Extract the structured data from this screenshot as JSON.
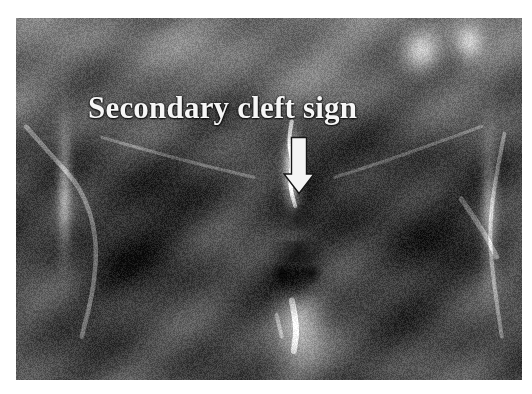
{
  "figure": {
    "kind": "medical-image",
    "modality": "MRI",
    "view": "coronal pelvis / pubic symphysis",
    "background_color": "#ffffff",
    "plate": {
      "x": 16,
      "y": 18,
      "width": 506,
      "height": 362,
      "base_color": "#2e2e2e"
    }
  },
  "annotation": {
    "label_text": "Secondary cleft sign",
    "label_color": "#f6f6f6",
    "label_x": 88,
    "label_y": 92,
    "label_font_size_px": 31,
    "arrow": {
      "icon": "down-arrow-icon",
      "color": "#f4f4f4",
      "x": 282,
      "y": 136,
      "width": 34,
      "height": 60,
      "direction": "down",
      "tip_x": 299,
      "tip_y": 194
    }
  },
  "scan": {
    "grayscale_range": [
      "#0a0a0a",
      "#f2f2f2"
    ],
    "noise_amount": 0.16,
    "regions": [
      {
        "name": "left-iliac-soft-tissue",
        "cx": 0.13,
        "cy": 0.18,
        "rx": 0.16,
        "ry": 0.16,
        "tone": 0.42
      },
      {
        "name": "right-iliac-soft-tissue",
        "cx": 0.62,
        "cy": 0.12,
        "rx": 0.2,
        "ry": 0.14,
        "tone": 0.46
      },
      {
        "name": "superior-bright-band",
        "cx": 0.42,
        "cy": 0.06,
        "rx": 0.34,
        "ry": 0.08,
        "tone": 0.5
      },
      {
        "name": "left-femoral-head-dark",
        "cx": 0.22,
        "cy": 0.58,
        "rx": 0.22,
        "ry": 0.33,
        "tone": 0.13
      },
      {
        "name": "right-femoral-head-dark",
        "cx": 0.78,
        "cy": 0.56,
        "rx": 0.22,
        "ry": 0.33,
        "tone": 0.14
      },
      {
        "name": "pubic-symphysis-dark",
        "cx": 0.55,
        "cy": 0.42,
        "rx": 0.1,
        "ry": 0.14,
        "tone": 0.1
      },
      {
        "name": "secondary-cleft-bright",
        "cx": 0.545,
        "cy": 0.42,
        "rx": 0.022,
        "ry": 0.13,
        "tone": 0.8
      },
      {
        "name": "perineal-fat-bright",
        "cx": 0.56,
        "cy": 0.84,
        "rx": 0.06,
        "ry": 0.14,
        "tone": 0.72
      },
      {
        "name": "genital-dark-lobes",
        "cx": 0.555,
        "cy": 0.71,
        "rx": 0.075,
        "ry": 0.08,
        "tone": 0.09
      },
      {
        "name": "upper-right-vessel-bright",
        "cx": 0.8,
        "cy": 0.09,
        "rx": 0.045,
        "ry": 0.07,
        "tone": 0.88
      },
      {
        "name": "upper-right-cortex-bright",
        "cx": 0.895,
        "cy": 0.065,
        "rx": 0.035,
        "ry": 0.06,
        "tone": 0.82
      },
      {
        "name": "left-fascial-stripe",
        "cx": 0.095,
        "cy": 0.46,
        "rx": 0.018,
        "ry": 0.22,
        "tone": 0.62
      },
      {
        "name": "right-fascial-stripe",
        "cx": 0.935,
        "cy": 0.52,
        "rx": 0.02,
        "ry": 0.24,
        "tone": 0.6
      }
    ]
  }
}
